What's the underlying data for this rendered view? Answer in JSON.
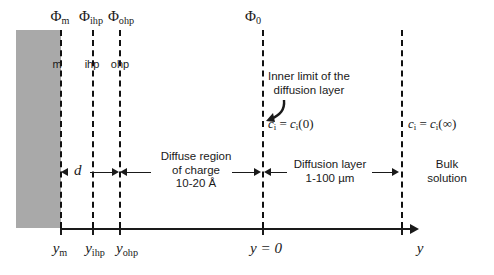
{
  "diagram": {
    "colors": {
      "electrode_gray": "#a9a9a9",
      "line": "#1a1a1a",
      "background": "#ffffff"
    },
    "electrode_block": {
      "label": "electrode-metal-block"
    },
    "potential_labels": [
      {
        "symbol": "Φ",
        "sub": "m",
        "x": 60
      },
      {
        "symbol": "Φ",
        "sub": "ihp",
        "x": 92
      },
      {
        "symbol": "Φ",
        "sub": "ohp",
        "x": 119
      },
      {
        "symbol": "Φ",
        "sub": "0",
        "x": 252
      }
    ],
    "plane_labels": [
      {
        "text": "m",
        "x": 60
      },
      {
        "text": "ihp",
        "x": 92
      },
      {
        "text": "ohp",
        "x": 119
      }
    ],
    "axis_labels": [
      {
        "symbol": "y",
        "sub": "m",
        "x": 60
      },
      {
        "symbol": "y",
        "sub": "ihp",
        "x": 93
      },
      {
        "symbol": "y",
        "sub": "ohp",
        "x": 122
      },
      {
        "symbol": "y = 0",
        "sub": "",
        "x": 262
      },
      {
        "symbol": "y",
        "sub": "",
        "x": 420
      }
    ],
    "regions": [
      {
        "name": "thickness-d",
        "label": "d",
        "italic": true
      },
      {
        "name": "diffuse-region",
        "lines": [
          "Diffuse region",
          "of charge",
          "10-20 Å"
        ]
      },
      {
        "name": "diffusion-layer",
        "lines": [
          "Diffusion layer",
          "1-100 µm"
        ]
      },
      {
        "name": "bulk-solution",
        "lines": [
          "Bulk",
          "solution"
        ]
      }
    ],
    "annotations": [
      {
        "name": "inner-limit-callout",
        "lines": [
          "Inner limit of the",
          "diffusion layer"
        ]
      }
    ],
    "equations": [
      {
        "name": "surface-concentration",
        "lhs": "c",
        "lhs_sub": "i",
        "rhs": "c",
        "rhs_sub": "i",
        "arg": "(0)"
      },
      {
        "name": "bulk-concentration",
        "lhs": "c",
        "lhs_sub": "i",
        "rhs": "c",
        "rhs_sub": "i",
        "arg": "(∞)"
      }
    ]
  }
}
